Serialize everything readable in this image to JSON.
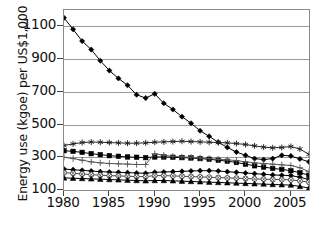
{
  "chart_data": {
    "type": "line",
    "title": "",
    "xlabel": "",
    "ylabel": "Energy use (kgoe) per US$1,000",
    "xlim": [
      1980,
      2007
    ],
    "ylim": [
      100,
      1200
    ],
    "yticks": [
      100,
      300,
      500,
      700,
      900,
      1100
    ],
    "xticks": [
      1980,
      1985,
      1990,
      1995,
      2000,
      2005
    ],
    "grid": true,
    "legend": "none",
    "x": [
      1980,
      1981,
      1982,
      1983,
      1984,
      1985,
      1986,
      1987,
      1988,
      1989,
      1990,
      1991,
      1992,
      1993,
      1994,
      1995,
      1996,
      1997,
      1998,
      1999,
      2000,
      2001,
      2002,
      2003,
      2004,
      2005,
      2006,
      2007
    ],
    "series": [
      {
        "name": "series-1-declining",
        "marker": "filled-diamond",
        "color": "#000000",
        "values": [
          1152,
          1082,
          1010,
          958,
          890,
          830,
          782,
          740,
          682,
          662,
          688,
          630,
          592,
          548,
          508,
          462,
          428,
          392,
          360,
          332,
          312,
          292,
          286,
          292,
          312,
          308,
          290,
          272
        ]
      },
      {
        "name": "series-2-asterisk",
        "marker": "asterisk",
        "color": "#222222",
        "values": [
          372,
          382,
          390,
          393,
          392,
          390,
          388,
          386,
          386,
          388,
          392,
          394,
          396,
          398,
          396,
          394,
          392,
          390,
          388,
          384,
          378,
          370,
          362,
          358,
          360,
          366,
          350,
          318
        ]
      },
      {
        "name": "series-3-square",
        "marker": "filled-square",
        "color": "#000000",
        "values": [
          340,
          336,
          330,
          322,
          316,
          310,
          306,
          302,
          300,
          298,
          302,
          302,
          300,
          298,
          296,
          292,
          288,
          282,
          276,
          268,
          258,
          248,
          240,
          232,
          226,
          218,
          206,
          190
        ]
      },
      {
        "name": "series-4-plus",
        "marker": "plus",
        "color": "#555555",
        "values": [
          300,
          292,
          282,
          272,
          266,
          262,
          260,
          258,
          256,
          256,
          322,
          312,
          306,
          302,
          300,
          296,
          292,
          288,
          284,
          280,
          272,
          266,
          262,
          258,
          254,
          250,
          236,
          212
        ]
      },
      {
        "name": "series-5-filled-diamond-low",
        "marker": "filled-diamond",
        "color": "#000000",
        "values": [
          228,
          224,
          220,
          216,
          212,
          210,
          208,
          206,
          204,
          202,
          208,
          210,
          212,
          214,
          216,
          218,
          218,
          216,
          212,
          208,
          204,
          200,
          196,
          192,
          190,
          188,
          178,
          164
        ]
      },
      {
        "name": "series-6-circle-x",
        "marker": "circle-x",
        "color": "#444444",
        "values": [
          206,
          202,
          198,
          194,
          190,
          188,
          186,
          184,
          182,
          182,
          188,
          188,
          186,
          184,
          182,
          180,
          178,
          176,
          174,
          172,
          170,
          168,
          166,
          164,
          164,
          162,
          156,
          148
        ]
      },
      {
        "name": "series-7-triangle",
        "marker": "filled-triangle",
        "color": "#000000",
        "values": [
          174,
          172,
          170,
          168,
          166,
          164,
          162,
          160,
          158,
          156,
          158,
          158,
          156,
          154,
          152,
          150,
          148,
          146,
          144,
          142,
          140,
          138,
          136,
          134,
          132,
          130,
          122,
          112
        ]
      }
    ]
  },
  "axis": {
    "ylabel_text": "Energy use (kgoe) per US$1,000",
    "ytick_labels": [
      "100",
      "300",
      "500",
      "700",
      "900",
      "1100"
    ],
    "xtick_labels": [
      "1980",
      "1985",
      "1990",
      "1995",
      "2000",
      "2005"
    ]
  },
  "caption": {
    "text": ""
  }
}
